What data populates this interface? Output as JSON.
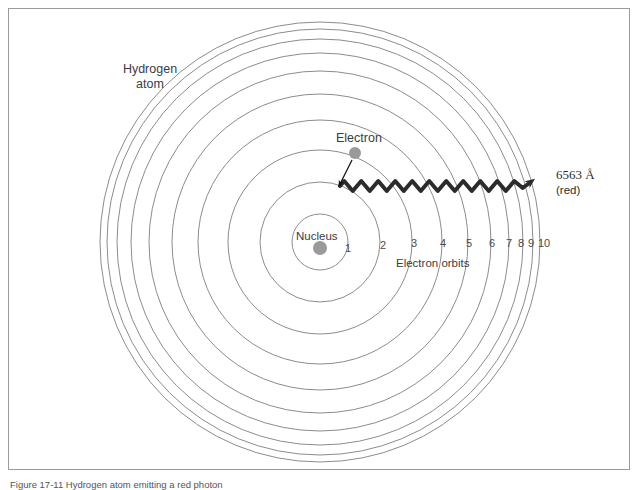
{
  "figure": {
    "caption": "Figure 17-11   Hydrogen atom emitting a red photon",
    "background_color": "#ffffff",
    "frame_color": "#9b9b9b"
  },
  "labels": {
    "hydrogen_atom_line1": "Hydrogen",
    "hydrogen_atom_line2": "atom",
    "electron": "Electron",
    "nucleus": "Nucleus",
    "electron_orbits": "Electron orbits",
    "wavelength": "6563 Å",
    "wavelength_color_name": "(red)"
  },
  "colors": {
    "orbit_stroke": "#8c8c8c",
    "nucleus_dot": "#9a9a9a",
    "electron_dot": "#9a9a9a",
    "photon_wave": "#2b2b2b",
    "pointer_arrow": "#111111",
    "text": "#3c3c3c"
  },
  "atom": {
    "center_x": 320,
    "center_y": 242,
    "nucleus_radius": 7,
    "orbit_count": 10,
    "orbit_numbers": [
      "1",
      "2",
      "3",
      "4",
      "5",
      "6",
      "7",
      "8",
      "9",
      "10"
    ],
    "orbit_radii": [
      28,
      60,
      92,
      122,
      148,
      171,
      189,
      203,
      213,
      220
    ],
    "nucleus_dot_x": 320,
    "nucleus_dot_y": 248
  },
  "electron": {
    "dot_x": 355,
    "dot_y": 153,
    "dot_radius": 6,
    "pointer_from_x": 352,
    "pointer_from_y": 160,
    "pointer_to_x": 339,
    "pointer_to_y": 186
  },
  "photon": {
    "wave_start_x": 340,
    "wave_start_y": 186,
    "wave_end_x": 528,
    "wave_end_y": 186,
    "wavelength_px": 17,
    "amplitude_px": 5,
    "stroke_width": 4,
    "arrow_tip_x": 562,
    "arrow_tip_y": 182
  }
}
